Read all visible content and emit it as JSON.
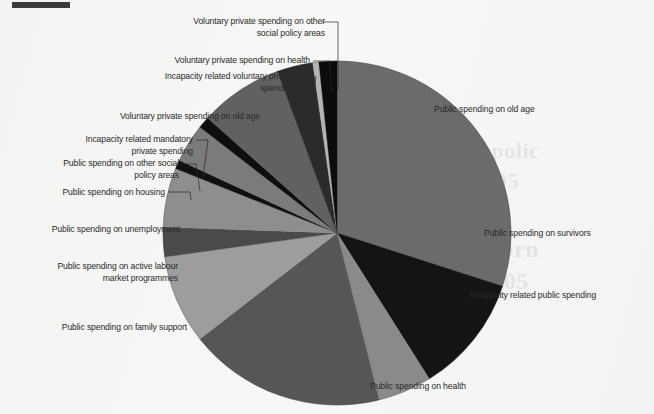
{
  "figure": {
    "background_color": "#f3f3f1",
    "corner_rule_color": "#3b3b3b",
    "bleed_text": {
      "line1": "social polic",
      "line2": "and 2005",
      "line3": "ent inforn",
      "line4": "and 2005"
    }
  },
  "chart_data": {
    "type": "pie",
    "title": "",
    "subtitle": "",
    "xlabel": "",
    "ylabel": "",
    "legend_position": "callout-labels",
    "grid": false,
    "center": {
      "x": 337,
      "y": 233
    },
    "radius": {
      "x": 174,
      "y": 172
    },
    "start_angle_deg": 0,
    "direction": "clockwise",
    "units": "percent of total social expenditure",
    "categories": [
      "Public spending on old age",
      "Public spending on survivors",
      "Incapacity related public spending",
      "Public spending on health",
      "Public spending on family support",
      "Public spending on active labour market programmes",
      "Public spending on unemployment",
      "Public spending on housing",
      "Public spending on other social policy areas",
      "Incapacity related mandatory private spending",
      "Voluntary private spending on old age",
      "Incapacity related voluntary private spending",
      "Voluntary private spending on health",
      "Voluntary private spending on other social policy areas"
    ],
    "values": [
      30.0,
      11.1,
      5.0,
      18.3,
      8.3,
      2.8,
      5.6,
      0.8,
      3.6,
      1.1,
      7.8,
      3.3,
      0.6,
      1.7
    ],
    "colors": [
      "#6b6b6b",
      "#141414",
      "#8a8a8a",
      "#565656",
      "#9d9d9d",
      "#4a4a4a",
      "#8e8e8e",
      "#101010",
      "#7b7b7b",
      "#0e0e0e",
      "#616161",
      "#2b2b2b",
      "#b4b4b2",
      "#0c0c0c"
    ],
    "slices": [
      {
        "label": "Public spending on old age",
        "value": 30.0,
        "start_deg": 0.0,
        "end_deg": 108.0,
        "color": "#6b6b6b"
      },
      {
        "label": "Public spending on survivors",
        "value": 11.1,
        "start_deg": 108.0,
        "end_deg": 148.0,
        "color": "#141414"
      },
      {
        "label": "Incapacity related public spending",
        "value": 5.0,
        "start_deg": 148.0,
        "end_deg": 166.0,
        "color": "#8a8a8a"
      },
      {
        "label": "Public spending on health",
        "value": 18.3,
        "start_deg": 166.0,
        "end_deg": 232.0,
        "color": "#565656"
      },
      {
        "label": "Public spending on family support",
        "value": 8.3,
        "start_deg": 232.0,
        "end_deg": 262.0,
        "color": "#9d9d9d"
      },
      {
        "label": "Public spending on active labour market programmes",
        "value": 2.8,
        "start_deg": 262.0,
        "end_deg": 272.0,
        "color": "#4a4a4a"
      },
      {
        "label": "Public spending on unemployment",
        "value": 5.6,
        "start_deg": 272.0,
        "end_deg": 292.0,
        "color": "#8e8e8e"
      },
      {
        "label": "Public spending on housing",
        "value": 0.8,
        "start_deg": 292.0,
        "end_deg": 295.0,
        "color": "#101010"
      },
      {
        "label": "Public spending on other social policy areas",
        "value": 3.6,
        "start_deg": 295.0,
        "end_deg": 308.0,
        "color": "#7b7b7b"
      },
      {
        "label": "Incapacity related mandatory private spending",
        "value": 1.1,
        "start_deg": 308.0,
        "end_deg": 312.0,
        "color": "#0e0e0e"
      },
      {
        "label": "Voluntary private spending on old age",
        "value": 7.8,
        "start_deg": 312.0,
        "end_deg": 340.0,
        "color": "#616161"
      },
      {
        "label": "Incapacity related voluntary private spending",
        "value": 3.3,
        "start_deg": 340.0,
        "end_deg": 352.0,
        "color": "#2b2b2b"
      },
      {
        "label": "Voluntary private spending on health",
        "value": 0.6,
        "start_deg": 352.0,
        "end_deg": 354.0,
        "color": "#b4b4b2"
      },
      {
        "label": "Voluntary private spending on other social policy areas",
        "value": 1.7,
        "start_deg": 354.0,
        "end_deg": 360.0,
        "color": "#0c0c0c"
      }
    ]
  },
  "labels": {
    "voluntary_other_social": "Voluntary private spending on other\nsocial policy areas",
    "voluntary_health": "Voluntary private spending on health",
    "incapacity_voluntary": "Incapacity related voluntary private\nspending",
    "voluntary_old_age": "Voluntary private spending on old age",
    "incapacity_mandatory": "Incapacity related mandatory\nprivate spending",
    "public_other_social": "Public spending on other social\npolicy areas",
    "public_housing": "Public spending on housing",
    "public_unemployment": "Public spending on unemployment",
    "public_almp": "Public spending on active labour\nmarket programmes",
    "public_family": "Public spending on family support",
    "public_health": "Public spending on health",
    "public_old_age": "Public spending on old age",
    "public_survivors": "Public spending on survivors",
    "incapacity_public": "Incapacity related public spending"
  }
}
